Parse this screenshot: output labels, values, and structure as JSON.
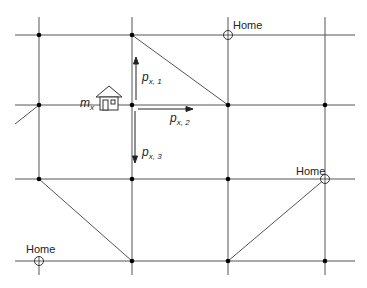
{
  "diagram": {
    "type": "road-grid-network",
    "grid": {
      "vertical_x": [
        39,
        132,
        228,
        325
      ],
      "horizontal_y": [
        35,
        105,
        179,
        261
      ]
    },
    "labels": {
      "home_top": "Home",
      "home_right": "Home",
      "home_bottom_left": "Home",
      "agent": "m",
      "agent_sub": "x",
      "p1": "p",
      "p1_sub": "x, 1",
      "p2": "p",
      "p2_sub": "x, 2",
      "p3": "p",
      "p3_sub": "x, 3"
    },
    "homes": [
      {
        "label": "Home",
        "x": 228,
        "y": 35
      },
      {
        "label": "Home",
        "x": 325,
        "y": 179
      },
      {
        "label": "Home",
        "x": 39,
        "y": 261
      }
    ],
    "icons": {
      "agent_house": "house-icon",
      "home_marker": "circle-cross-icon"
    },
    "colors": {
      "line": "#444444",
      "node": "#000000",
      "background": "#ffffff"
    }
  }
}
